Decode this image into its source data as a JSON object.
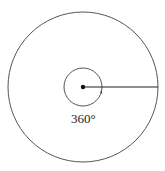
{
  "diagram": {
    "title": "",
    "angle_label": "360°",
    "stroke_color": "#555555",
    "point_color": "#111111",
    "outer_circle": {
      "cx": 83,
      "cy": 87,
      "r": 75
    },
    "inner_circle": {
      "cx": 83,
      "cy": 87,
      "r": 19
    },
    "radius_line": {
      "x1": 83,
      "y1": 87,
      "x2": 158,
      "y2": 87
    }
  }
}
